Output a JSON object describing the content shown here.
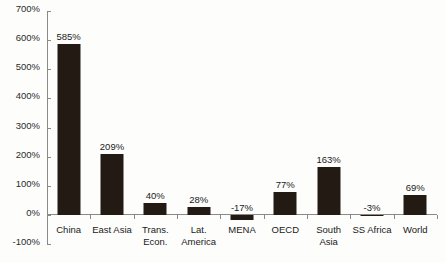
{
  "chart_data": {
    "type": "bar",
    "title": "",
    "subtitle": "",
    "xlabel": "",
    "ylabel": "",
    "categories": [
      "China",
      "East Asia",
      "Trans.\nEcon.",
      "Lat.\nAmerica",
      "MENA",
      "OECD",
      "South\nAsia",
      "SS Africa",
      "World"
    ],
    "values": [
      585,
      209,
      40,
      28,
      -17,
      77,
      163,
      -3,
      69
    ],
    "value_labels": [
      "585%",
      "209%",
      "40%",
      "28%",
      "-17%",
      "77%",
      "163%",
      "-3%",
      "69%"
    ],
    "ylim": [
      -100,
      700
    ],
    "ytick_values": [
      700,
      600,
      500,
      400,
      300,
      200,
      100,
      0,
      -100
    ],
    "ytick_labels": [
      "700%",
      "600%",
      "500%",
      "400%",
      "300%",
      "200%",
      "100%",
      "0%",
      "-100%"
    ],
    "grid": false,
    "legend": "none",
    "bar_color": "#231a14",
    "axis_color": "#8a8a86",
    "background_color": "#fdfdfc"
  }
}
